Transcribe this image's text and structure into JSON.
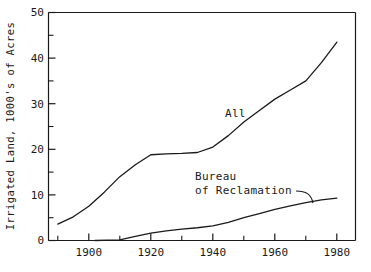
{
  "chart_data": {
    "type": "line",
    "title": "",
    "xlabel": "",
    "ylabel": "Irrigated Land, 1000's of Acres",
    "xlim": [
      1887,
      1986
    ],
    "ylim": [
      0,
      50
    ],
    "grid": false,
    "legend_position": "inline-annotations",
    "x_ticks": [
      1900,
      1920,
      1940,
      1960,
      1980
    ],
    "x_tick_labels": [
      "1900",
      "1920",
      "1940",
      "1960",
      "1980"
    ],
    "x_minor_tick_step": 5,
    "y_ticks": [
      0,
      10,
      20,
      30,
      40,
      50
    ],
    "y_tick_labels": [
      "0",
      "10",
      "20",
      "30",
      "40",
      "50"
    ],
    "y_minor_tick_step": 5,
    "line_color": "#1a1a1a",
    "background_color": "#ffffff",
    "series": [
      {
        "name": "All",
        "label": "All",
        "x": [
          1890,
          1895,
          1900,
          1905,
          1910,
          1915,
          1920,
          1925,
          1930,
          1935,
          1940,
          1945,
          1950,
          1955,
          1960,
          1965,
          1970,
          1975,
          1980
        ],
        "values": [
          3.6,
          5.2,
          7.5,
          10.6,
          14.0,
          16.6,
          18.8,
          19.0,
          19.1,
          19.3,
          20.5,
          23.0,
          26.0,
          28.5,
          31.0,
          33.0,
          35.0,
          39.0,
          43.5
        ]
      },
      {
        "name": "Bureau of Reclamation",
        "label": "Bureau\nof Reclamation",
        "x": [
          1902,
          1910,
          1915,
          1920,
          1925,
          1930,
          1935,
          1940,
          1945,
          1950,
          1955,
          1960,
          1965,
          1970,
          1975,
          1980
        ],
        "values": [
          0.0,
          0.15,
          0.9,
          1.6,
          2.1,
          2.5,
          2.8,
          3.2,
          4.0,
          5.0,
          5.9,
          6.8,
          7.6,
          8.3,
          8.9,
          9.3
        ]
      }
    ],
    "annotations": [
      {
        "text": "All",
        "x": 1953,
        "y": 25.5,
        "leader": false
      },
      {
        "text": "Bureau",
        "x": 1938,
        "y": 14.5,
        "leader": false
      },
      {
        "text": "of Reclamation",
        "x": 1938,
        "y": 11.8,
        "leader": true
      }
    ]
  },
  "axis": {
    "y_title": "Irrigated Land, 1000's of Acres",
    "y_tick_0": "0",
    "y_tick_10": "10",
    "y_tick_20": "20",
    "y_tick_30": "30",
    "y_tick_40": "40",
    "y_tick_50": "50",
    "x_tick_1900": "1900",
    "x_tick_1920": "1920",
    "x_tick_1940": "1940",
    "x_tick_1960": "1960",
    "x_tick_1980": "1980"
  },
  "labels": {
    "all_series": "All",
    "bureau_line1": "Bureau",
    "bureau_line2": "of Reclamation"
  }
}
